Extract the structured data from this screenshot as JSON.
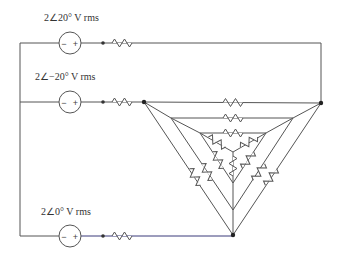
{
  "diagram": {
    "type": "circuit",
    "sources": [
      {
        "id": "v1",
        "label": "2∠20° V rms",
        "magnitude": 2,
        "phase_deg": 20,
        "unit": "V rms",
        "polarity": "- +"
      },
      {
        "id": "v2",
        "label": "2∠−20° V rms",
        "magnitude": 2,
        "phase_deg": -20,
        "unit": "V rms",
        "polarity": "- +"
      },
      {
        "id": "v3",
        "label": "2∠0° V rms",
        "magnitude": 2,
        "phase_deg": 0,
        "unit": "V rms",
        "polarity": "- +"
      }
    ],
    "line_resistors": 3,
    "network": "nested delta/wye resistor network (triangle with 3 delta layers and inner wye)",
    "colors": {
      "wire": "#555555",
      "background": "#ffffff",
      "bottom_wire": "#3a3a7a"
    }
  }
}
